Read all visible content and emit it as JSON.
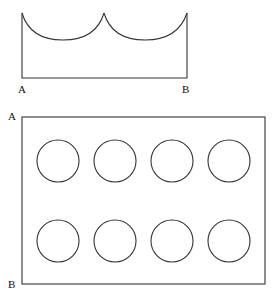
{
  "figure_top": {
    "label_left": "A",
    "label_right": "B",
    "description": "Open-top rectangle with two concave semicircular arcs along the top edge"
  },
  "figure_bottom": {
    "label_top": "A",
    "label_bottom": "B",
    "description": "Rectangle containing 8 circles arranged in 2 rows of 4",
    "rows": 2,
    "columns": 4,
    "circles": [
      {
        "cx": 58,
        "cy": 161
      },
      {
        "cx": 115,
        "cy": 161
      },
      {
        "cx": 172,
        "cy": 161
      },
      {
        "cx": 229,
        "cy": 161
      },
      {
        "cx": 58,
        "cy": 241
      },
      {
        "cx": 115,
        "cy": 241
      },
      {
        "cx": 172,
        "cy": 241
      },
      {
        "cx": 229,
        "cy": 241
      }
    ]
  }
}
